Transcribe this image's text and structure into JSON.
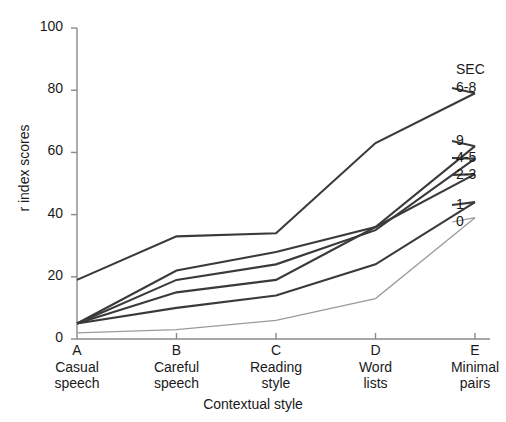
{
  "chart_data": {
    "type": "line",
    "title": "",
    "subtitle": "",
    "xlabel": "Contextual style",
    "ylabel": "r index scores",
    "categories": [
      "A",
      "B",
      "C",
      "D",
      "E"
    ],
    "category_descriptions": [
      "Casual speech",
      "Careful speech",
      "Reading style",
      "Word lists",
      "Minimal pairs"
    ],
    "category_desc_lines": [
      [
        "Casual",
        "speech"
      ],
      [
        "Careful",
        "speech"
      ],
      [
        "Reading",
        "style"
      ],
      [
        "Word",
        "lists"
      ],
      [
        "Minimal",
        "pairs"
      ]
    ],
    "ylim": [
      0,
      100
    ],
    "yticks": [
      0,
      20,
      40,
      60,
      80,
      100
    ],
    "ytick_labels": [
      "0",
      "20",
      "40",
      "60",
      "80",
      "100"
    ],
    "grid": false,
    "legend_position": "right-inline",
    "legend_title": "SEC",
    "series": [
      {
        "name": "6-8",
        "values": [
          19,
          33,
          34,
          63,
          79
        ],
        "style": "bold"
      },
      {
        "name": "9",
        "values": [
          5,
          22,
          28,
          36,
          62
        ],
        "style": "bold"
      },
      {
        "name": "4-5",
        "values": [
          5,
          19,
          24,
          35,
          58
        ],
        "style": "bold"
      },
      {
        "name": "2-3",
        "values": [
          5,
          15,
          19,
          36,
          53
        ],
        "style": "bold"
      },
      {
        "name": "1",
        "values": [
          5,
          10,
          14,
          24,
          44
        ],
        "style": "bold"
      },
      {
        "name": "0",
        "values": [
          2,
          3,
          6,
          13,
          39
        ],
        "style": "thin"
      }
    ]
  },
  "colors": {
    "line": "#3a3a3a",
    "line_thin": "#9a9a9a",
    "axis": "#8a8a8a",
    "text": "#1a1a1a",
    "background": "#ffffff"
  }
}
